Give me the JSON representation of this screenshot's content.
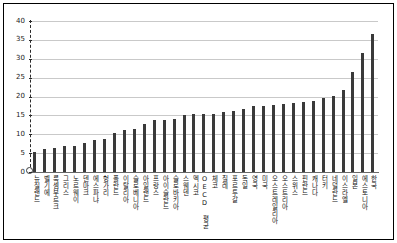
{
  "chart_data": {
    "type": "bar",
    "title": "",
    "subtitle": "",
    "xlabel": "",
    "ylabel": "",
    "ylim": [
      0,
      40
    ],
    "yticks": [
      0,
      5,
      10,
      15,
      20,
      25,
      30,
      35,
      40
    ],
    "grid": true,
    "legend": null,
    "bar_color": "#3a3a3a",
    "gridline_color": "#c9c9c9",
    "axis_color": "#2a2a2a",
    "categories": [
      "뉴질랜드",
      "벨기에",
      "룩셈부르크",
      "그리스",
      "노르웨이",
      "덴마크",
      "에스파냐",
      "헝가리",
      "폴란드",
      "이탈리아",
      "슬로베니아",
      "아일랜드",
      "프랑스",
      "아이슬란드",
      "슬로바키아",
      "스웨덴",
      "멕시코",
      "OECD 평균",
      "체코",
      "칠레",
      "포르투갈",
      "독일",
      "영국",
      "미국",
      "오스트레일리아",
      "오스트리아",
      "스위스",
      "핀란드",
      "캐나다",
      "터키",
      "네덜란드",
      "이스라엘",
      "일본",
      "에스토니아",
      "한국"
    ],
    "values": [
      5.4,
      6.2,
      6.4,
      6.8,
      6.9,
      7.7,
      8.5,
      8.7,
      10.4,
      11.0,
      11.3,
      12.7,
      13.9,
      13.8,
      14.1,
      15.1,
      15.3,
      15.3,
      15.5,
      15.9,
      16.2,
      16.6,
      17.4,
      17.6,
      17.8,
      18.0,
      18.4,
      18.6,
      18.7,
      19.7,
      20.2,
      21.6,
      26.4,
      31.4,
      36.5
    ]
  }
}
